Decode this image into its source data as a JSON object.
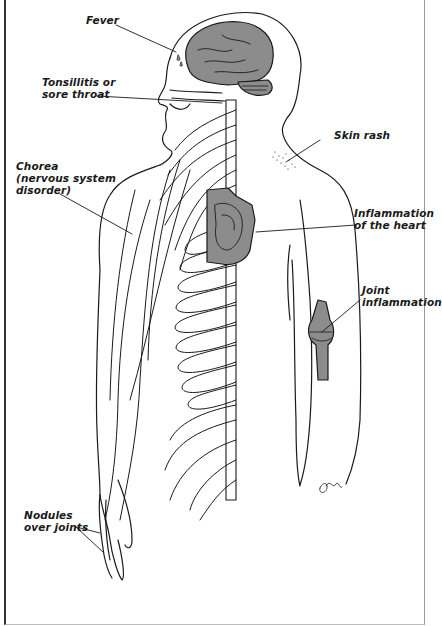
{
  "figure": {
    "colors": {
      "line": "#1a1a1a",
      "organ_fill": "#8c8c8c",
      "background": "#ffffff"
    },
    "labels": [
      {
        "id": "fever",
        "text": "Fever",
        "target": "brain"
      },
      {
        "id": "tonsillitis",
        "text": "Tonsillitis or\nsore throat",
        "target": "throat"
      },
      {
        "id": "skin-rash",
        "text": "Skin rash",
        "target": "shoulder-skin"
      },
      {
        "id": "chorea",
        "text": "Chorea\n(nervous system\ndisorder)",
        "target": "nerves"
      },
      {
        "id": "heart",
        "text": "Inflammation\nof the heart",
        "target": "heart"
      },
      {
        "id": "joint",
        "text": "Joint\ninflammation",
        "target": "elbow-joint"
      },
      {
        "id": "nodules",
        "text": "Nodules\nover joints",
        "target": "fingers"
      }
    ],
    "signature": "JM"
  }
}
